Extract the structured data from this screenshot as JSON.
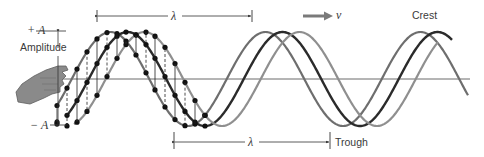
{
  "labels": {
    "plus_a": "+ A",
    "minus_a": "− A",
    "amplitude": "Amplitude",
    "lambda_top": "λ",
    "lambda_bottom": "λ",
    "velocity": "v",
    "crest": "Crest",
    "trough": "Trough"
  },
  "colors": {
    "wave_left": "#6e6e6e",
    "wave_middle": "#2b2b2b",
    "wave_right": "#8f8f8f",
    "axis": "#555555",
    "dots": "#111111",
    "hand": "#8a8a8a",
    "arrow_v": "#7a7a7a",
    "text": "#3a3a3a"
  },
  "wave_model": {
    "baseline_y": 79,
    "amplitude_px": 47,
    "wavelength_px": 155,
    "waves": [
      {
        "name": "wave-left",
        "trough_x": 188,
        "x_start": 58,
        "x_end": 468,
        "color_key": "wave_left",
        "width": 2.2
      },
      {
        "name": "wave-middle",
        "trough_x": 205,
        "x_start": 66,
        "x_end": 452,
        "color_key": "wave_middle",
        "width": 2.4
      },
      {
        "name": "wave-right",
        "trough_x": 222,
        "x_start": 74,
        "x_end": 438,
        "color_key": "wave_right",
        "width": 2.2
      }
    ],
    "dot_x": [
      57,
      67,
      77,
      87,
      97,
      107,
      117,
      126,
      136,
      146,
      155,
      165,
      175,
      185,
      195,
      205
    ]
  }
}
